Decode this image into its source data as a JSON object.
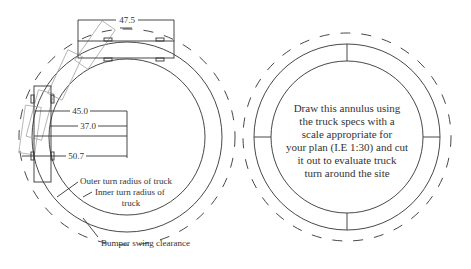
{
  "left_figure": {
    "dimensions": {
      "truck_length": "47.5",
      "outer_radius": "45.0",
      "inner_radius": "37.0",
      "bumper_radius": "50.7"
    },
    "labels": {
      "outer": "Outer turn radius of truck",
      "inner_line1": "Inner turn radius of",
      "inner_line2": "truck",
      "bumper": "Bumper swing clearance"
    }
  },
  "right_figure": {
    "instruction_lines": [
      "Draw this annulus using",
      "the truck specs with a",
      "scale appropriate for",
      "your plan (I.E 1:30) and cut",
      "it out to evaluate truck",
      "turn around the site"
    ]
  },
  "colors": {
    "line": "#333333",
    "ghost": "#aaaaaa",
    "background": "#ffffff"
  }
}
